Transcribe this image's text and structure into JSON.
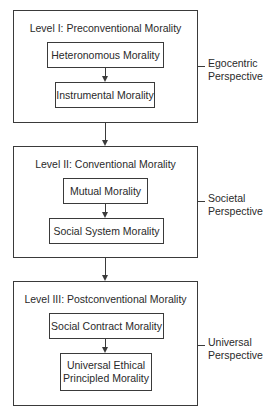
{
  "levels": [
    {
      "title": "Level I: Preconventional Morality",
      "stages": [
        "Heteronomous Morality",
        "Instrumental Morality"
      ],
      "perspective": [
        "Egocentric",
        "Perspective"
      ]
    },
    {
      "title": "Level II: Conventional Morality",
      "stages": [
        "Mutual Morality",
        "Social System Morality"
      ],
      "perspective": [
        "Societal",
        "Perspective"
      ]
    },
    {
      "title": "Level III: Postconventional Morality",
      "stages": [
        "Social Contract Morality",
        "Universal Ethical",
        "Principled Morality"
      ],
      "perspective": [
        "Universal",
        "Perspective"
      ]
    }
  ],
  "colors": {
    "line": "#3a3a3a",
    "text": "#2a2a2a",
    "background": "#ffffff"
  }
}
